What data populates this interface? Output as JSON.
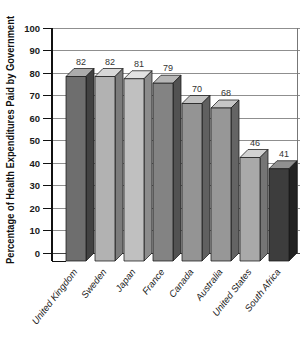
{
  "chart_data": {
    "type": "bar",
    "style": "3d-column",
    "title": "",
    "xlabel": "",
    "ylabel": "Percentage of Health Expenditures Paid by Government",
    "categories": [
      "United Kingdom",
      "Sweden",
      "Japan",
      "France",
      "Canada",
      "Australia",
      "United States",
      "South Africa"
    ],
    "values": [
      82,
      82,
      81,
      79,
      70,
      68,
      46,
      41
    ],
    "value_labels_shown": true,
    "ylim": [
      0,
      100
    ],
    "ytick_step": 10,
    "yticks": [
      0,
      10,
      20,
      30,
      40,
      50,
      60,
      70,
      80,
      90,
      100
    ],
    "grid": "horizontal",
    "legend": "none",
    "bar_colors": [
      {
        "front": "#6e6e6e",
        "top": "#ababab",
        "side": "#424242"
      },
      {
        "front": "#b2b2b2",
        "top": "#d8d8d8",
        "side": "#7c7c7c"
      },
      {
        "front": "#c0c0c0",
        "top": "#e2e2e2",
        "side": "#8c8c8c"
      },
      {
        "front": "#838383",
        "top": "#b6b6b6",
        "side": "#525252"
      },
      {
        "front": "#949494",
        "top": "#c2c2c2",
        "side": "#606060"
      },
      {
        "front": "#979797",
        "top": "#c5c5c5",
        "side": "#646464"
      },
      {
        "front": "#a9a9a9",
        "top": "#d1d1d1",
        "side": "#757575"
      },
      {
        "front": "#3d3d3d",
        "top": "#909090",
        "side": "#222222"
      }
    ],
    "colors": {
      "background": "#ffffff",
      "grid_line": "#8f8f8f",
      "baseline": "#444444",
      "axis_line": "#111111",
      "right_border": "#777777",
      "bar_outline": "#1a1a1a",
      "tick_text": "#1a1a1a",
      "value_text": "#333333"
    }
  }
}
